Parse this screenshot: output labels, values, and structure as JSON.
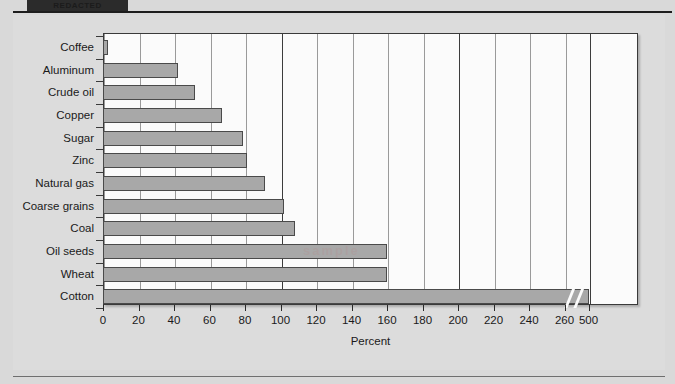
{
  "header": {
    "redacted_title": "REDACTED"
  },
  "watermark": {
    "text": "sample"
  },
  "chart_data": {
    "type": "bar",
    "orientation": "horizontal",
    "title": "",
    "xlabel": "Percent",
    "ylabel": "",
    "grid": true,
    "legend": false,
    "xlim": [
      0,
      500
    ],
    "axis_break": {
      "after": 260,
      "before": 500
    },
    "xticks": [
      0,
      20,
      40,
      60,
      80,
      100,
      120,
      140,
      160,
      180,
      200,
      220,
      240,
      260,
      500
    ],
    "categories": [
      "Coffee",
      "Aluminum",
      "Crude oil",
      "Copper",
      "Sugar",
      "Zinc",
      "Natural gas",
      "Coarse grains",
      "Coal",
      "Oil seeds",
      "Wheat",
      "Cotton"
    ],
    "values": [
      3,
      42,
      52,
      67,
      79,
      81,
      91,
      102,
      108,
      160,
      160,
      500
    ],
    "bar_color": "#a8a8a8",
    "bar_edge_color": "#4a4a4a",
    "plot_background": "#fbfbfb",
    "figure_background": "#dcdcdc"
  }
}
